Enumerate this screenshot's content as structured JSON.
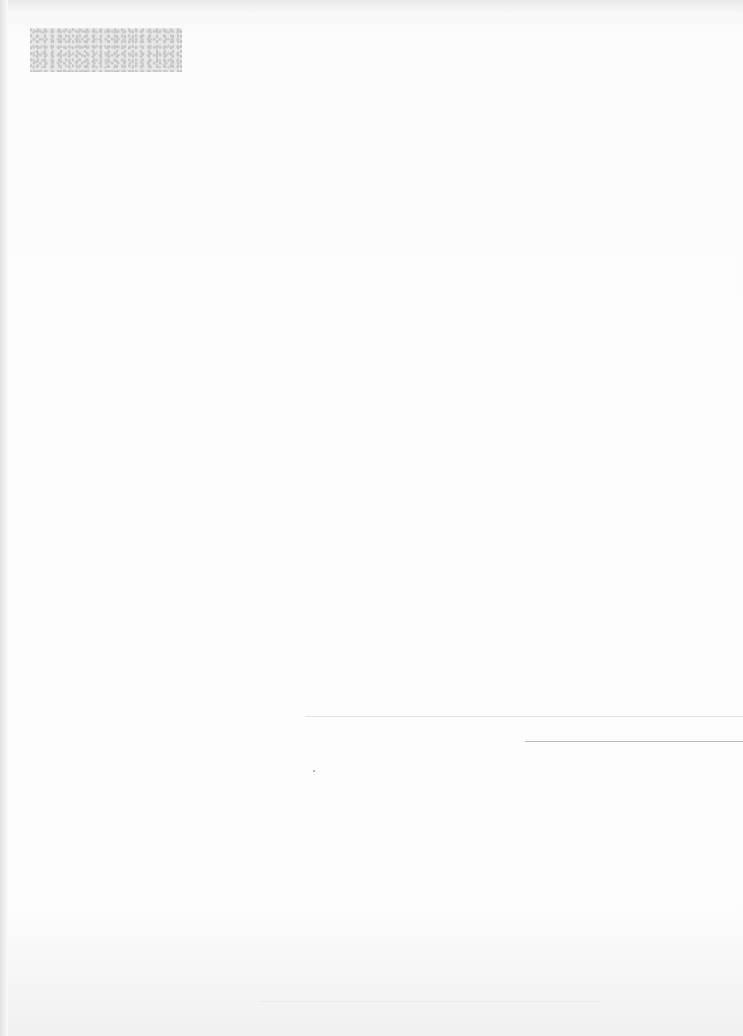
{
  "document": {
    "type": "scanned-page",
    "header_stamp": {
      "text": ""
    },
    "header_mark": "",
    "center_block": {
      "line1": "",
      "line2": ""
    },
    "rules": [
      {
        "position": "mid-right",
        "y": 716
      },
      {
        "position": "right-signature",
        "y": 741
      },
      {
        "position": "bottom",
        "y": 1001
      }
    ],
    "colors": {
      "paper": "#fafafa",
      "ink_faint": "#d0d0d0",
      "rule": "#bcbcbc"
    }
  }
}
